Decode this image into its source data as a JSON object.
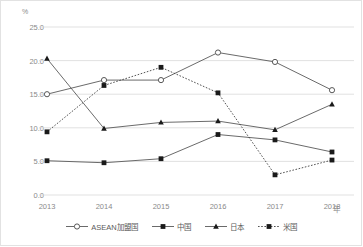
{
  "chart_data": {
    "type": "line",
    "title": "",
    "xlabel": "年",
    "ylabel": "%",
    "x": [
      "2013",
      "2014",
      "2015",
      "2016",
      "2017",
      "2018"
    ],
    "categories": [
      "2013",
      "2014",
      "2015",
      "2016",
      "2017",
      "2018"
    ],
    "ylim": [
      0.0,
      25.0
    ],
    "ytick_labels": [
      "0.0",
      "5.0",
      "10.0",
      "15.0",
      "20.0",
      "25.0"
    ],
    "ytick_values": [
      0.0,
      5.0,
      10.0,
      15.0,
      20.0,
      25.0
    ],
    "grid": true,
    "legend_position": "bottom",
    "series": [
      {
        "name": "ASEAN加盟国",
        "marker": "open-circle",
        "linestyle": "solid",
        "color": "#595959",
        "values": [
          15.0,
          17.1,
          17.1,
          21.2,
          19.8,
          15.6
        ]
      },
      {
        "name": "中国",
        "marker": "filled-square",
        "linestyle": "solid",
        "color": "#595959",
        "values": [
          5.1,
          4.8,
          5.4,
          9.0,
          8.2,
          6.4
        ]
      },
      {
        "name": "日本",
        "marker": "filled-triangle",
        "linestyle": "solid",
        "color": "#595959",
        "values": [
          20.3,
          9.9,
          10.8,
          11.0,
          9.7,
          13.5
        ]
      },
      {
        "name": "米国",
        "marker": "filled-square",
        "linestyle": "dotted",
        "color": "#404040",
        "values": [
          9.4,
          16.3,
          19.0,
          15.2,
          3.0,
          5.2
        ]
      }
    ]
  },
  "axis": {
    "y_unit": "%",
    "x_unit": "年"
  }
}
